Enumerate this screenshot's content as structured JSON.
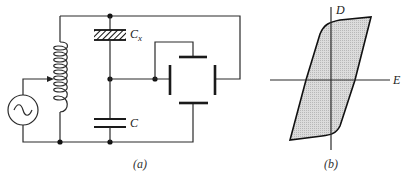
{
  "figure": {
    "panel_a": {
      "caption": "(a)",
      "labels": {
        "test_capacitor": "C",
        "test_capacitor_sub": "x",
        "reference_capacitor": "C"
      },
      "components": [
        "ac-source",
        "tapped-inductor",
        "ferroelectric-capacitor-Cx",
        "linear-capacitor-C",
        "four-plate-deflection-electrodes"
      ]
    },
    "panel_b": {
      "caption": "(b)",
      "axes": {
        "vertical": "D",
        "horizontal": "E"
      },
      "curve": "hysteresis-loop"
    },
    "colors": {
      "line": "#2a2a2a",
      "fill": "#d4d4d4",
      "background": "#ffffff"
    }
  }
}
